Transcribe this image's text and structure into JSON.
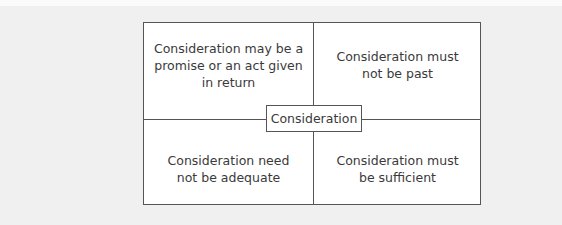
{
  "diagram": {
    "center_label": "Consideration",
    "quadrants": [
      {
        "position": "top-left",
        "text": "Consideration may be a promise or an act given in return"
      },
      {
        "position": "top-right",
        "text": "Consideration must not be past"
      },
      {
        "position": "bottom-left",
        "text": "Consideration need not be adequate"
      },
      {
        "position": "bottom-right",
        "text": "Consideration must be sufficient"
      }
    ],
    "colors": {
      "background": "#f0f0f0",
      "box": "#ffffff",
      "border": "#555555",
      "text": "#3a3a3a"
    }
  }
}
